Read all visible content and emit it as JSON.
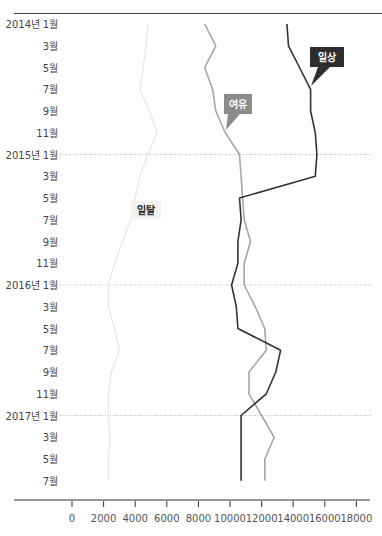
{
  "chart_data": {
    "type": "line",
    "title": "",
    "orientation": "vertical-time",
    "xlabel": "",
    "ylabel": "",
    "xlim": [
      0,
      18000
    ],
    "x_ticks": [
      0,
      2000,
      4000,
      6000,
      8000,
      10000,
      12000,
      14000,
      16000,
      18000
    ],
    "categories": [
      "2014년 1월",
      "3월",
      "5월",
      "7월",
      "9월",
      "11월",
      "2015년 1월",
      "3월",
      "5월",
      "7월",
      "9월",
      "11월",
      "2016년 1월",
      "3월",
      "5월",
      "7월",
      "9월",
      "11월",
      "2017년 1월",
      "3월",
      "5월",
      "7월"
    ],
    "year_gridlines": [
      "2015년 1월",
      "2016년 1월",
      "2017년 1월"
    ],
    "series": [
      {
        "name": "일상",
        "color": "#333333",
        "values": [
          13600,
          13700,
          14400,
          15100,
          15100,
          15400,
          15500,
          15400,
          10600,
          10700,
          10500,
          10500,
          10100,
          10400,
          10500,
          13200,
          12900,
          12300,
          10700,
          10700,
          10700,
          10700
        ]
      },
      {
        "name": "여유",
        "color": "#a6a6a6",
        "values": [
          8400,
          9100,
          8400,
          8900,
          9100,
          9700,
          10600,
          10700,
          10800,
          10900,
          11300,
          10900,
          10900,
          11600,
          12200,
          12300,
          11200,
          11200,
          12000,
          12800,
          12200,
          12200
        ]
      },
      {
        "name": "일탈",
        "color": "#e8e8e8",
        "values": [
          4800,
          4700,
          4500,
          4300,
          4900,
          5400,
          4800,
          4300,
          4000,
          3700,
          3200,
          2700,
          2300,
          2300,
          2700,
          3000,
          2500,
          2300,
          2300,
          2400,
          2300,
          2300
        ]
      }
    ],
    "legend": "inline-labels",
    "grid": "dotted horizontal at each January"
  },
  "labels": {
    "series_1": "일상",
    "series_2": "여유",
    "series_3": "일탈"
  },
  "y_labels": [
    {
      "year": "2014년",
      "month": "1월"
    },
    {
      "year": "",
      "month": "3월"
    },
    {
      "year": "",
      "month": "5월"
    },
    {
      "year": "",
      "month": "7월"
    },
    {
      "year": "",
      "month": "9월"
    },
    {
      "year": "",
      "month": "11월"
    },
    {
      "year": "2015년",
      "month": "1월"
    },
    {
      "year": "",
      "month": "3월"
    },
    {
      "year": "",
      "month": "5월"
    },
    {
      "year": "",
      "month": "7월"
    },
    {
      "year": "",
      "month": "9월"
    },
    {
      "year": "",
      "month": "11월"
    },
    {
      "year": "2016년",
      "month": "1월"
    },
    {
      "year": "",
      "month": "3월"
    },
    {
      "year": "",
      "month": "5월"
    },
    {
      "year": "",
      "month": "7월"
    },
    {
      "year": "",
      "month": "9월"
    },
    {
      "year": "",
      "month": "11월"
    },
    {
      "year": "2017년",
      "month": "1월"
    },
    {
      "year": "",
      "month": "3월"
    },
    {
      "year": "",
      "month": "5월"
    },
    {
      "year": "",
      "month": "7월"
    }
  ]
}
